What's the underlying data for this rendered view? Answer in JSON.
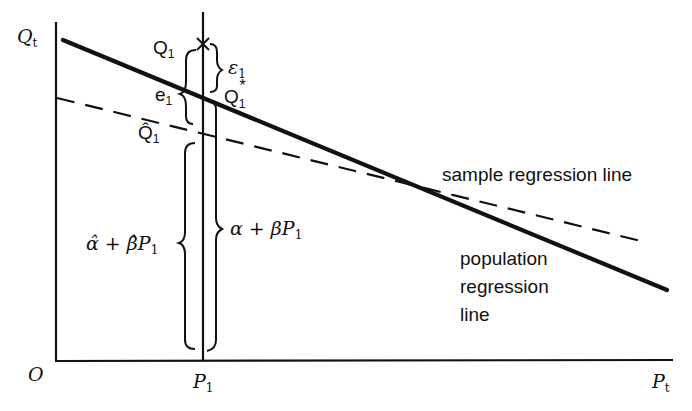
{
  "diagram": {
    "type": "regression-illustration",
    "axes": {
      "origin_label": "O",
      "y_axis_label": "Q",
      "y_axis_sub": "t",
      "x_axis_label": "P",
      "x_axis_sub": "t"
    },
    "ticks": {
      "x_tick_label": "P",
      "x_tick_sub": "1"
    },
    "points": {
      "observed": {
        "label": "Q",
        "sub": "1"
      },
      "population_fit": {
        "label": "Q",
        "sub": "1",
        "sup": "*"
      },
      "sample_fit": {
        "label": "Q̂",
        "sub": "1"
      }
    },
    "braces": {
      "error_true": {
        "label": "ε",
        "sub": "1"
      },
      "residual": {
        "label": "e",
        "sub": "1"
      },
      "population_value": {
        "text_a": "α + β",
        "text_b": "P",
        "sub": "1"
      },
      "sample_value": {
        "text_a": "α̂ + β̂",
        "text_b": "P",
        "sub": "1"
      }
    },
    "lines": {
      "sample": {
        "label": "sample regression line",
        "style": "dashed"
      },
      "population": {
        "label_lines": [
          "population",
          "regression",
          "line"
        ],
        "style": "solid"
      }
    },
    "colors": {
      "ink": "#111111",
      "background": "#ffffff"
    }
  }
}
